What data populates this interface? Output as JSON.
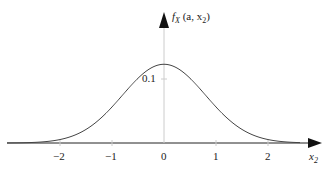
{
  "chart_data": {
    "type": "line",
    "title": "",
    "xlabel": "x2",
    "ylabel": "f_X(a, x2)",
    "x_ticks": [
      -2,
      -1,
      0,
      1,
      2
    ],
    "x_tick_labels": [
      "−2",
      "−1",
      "0",
      "1",
      "2"
    ],
    "y_ticks": [
      0.1
    ],
    "y_tick_labels": [
      "0.1"
    ],
    "xlim": [
      -3.0,
      3.0
    ],
    "ylim": [
      0,
      0.2
    ],
    "grid": false,
    "series": [
      {
        "name": "f_X(a, x2)",
        "shape": "gaussian",
        "mean": 0,
        "std": 0.8,
        "peak": 0.123,
        "x": [
          -3.0,
          -2.5,
          -2.0,
          -1.5,
          -1.0,
          -0.5,
          0,
          0.5,
          1.0,
          1.5,
          2.0,
          2.5,
          3.0
        ],
        "values": [
          0.0001,
          0.0009,
          0.0054,
          0.021,
          0.056,
          0.101,
          0.123,
          0.101,
          0.056,
          0.021,
          0.0054,
          0.0009,
          0.0001
        ]
      }
    ]
  },
  "labels": {
    "y_axis": "f",
    "y_axis_sub": "X",
    "y_axis_args": " (a, x",
    "y_axis_args_sub": "2",
    "y_axis_close": ")",
    "x_axis": "x",
    "x_axis_sub": "2",
    "ytick": "0.1",
    "xticks": [
      "−2",
      "−1",
      "0",
      "1",
      "2"
    ]
  }
}
